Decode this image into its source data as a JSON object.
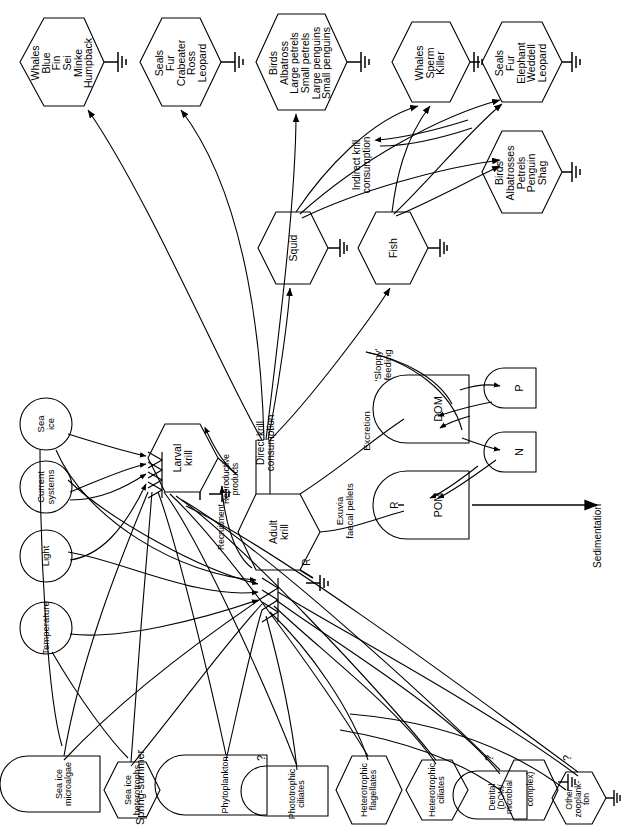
{
  "diagram": {
    "orientation": "text rotated 90 degrees counter-clockwise",
    "line_color": "#000000",
    "background_color": "#ffffff"
  },
  "consumers_top": [
    {
      "id": "whales-baleen",
      "shape": "hexagon",
      "label": "Whales\nBlue\nFin\nSei\nMinke\nHumpback"
    },
    {
      "id": "seals-1",
      "shape": "hexagon",
      "label": "Seals\nFur\nCrabeater\nRoss\nLeopard"
    },
    {
      "id": "birds-1",
      "shape": "hexagon",
      "label": "Birds\nAlbatross\nLarge petrels\nSmall petrels\nLarge penguins\nSmall penguins"
    },
    {
      "id": "whales-toothed",
      "shape": "hexagon",
      "label": "Whales\nSperm\nKiller"
    },
    {
      "id": "seals-2",
      "shape": "hexagon",
      "label": "Seals\nFur\nElephant\nWeddell\nLeopard"
    },
    {
      "id": "birds-2",
      "shape": "hexagon",
      "label": "Birds\nAlbatrosses\nPetrels\nPenguin\nShag"
    }
  ],
  "mid_consumers": [
    {
      "id": "squid",
      "shape": "hexagon",
      "label": "Squid"
    },
    {
      "id": "fish",
      "shape": "hexagon",
      "label": "Fish"
    }
  ],
  "krill": [
    {
      "id": "larval-krill",
      "shape": "hexagon",
      "label": "Larval\nkrill"
    },
    {
      "id": "adult-krill",
      "shape": "hexagon",
      "label": "Adult\nkrill"
    }
  ],
  "nutrient_pools": [
    {
      "id": "dom",
      "shape": "tank",
      "label": "DOM"
    },
    {
      "id": "pom",
      "shape": "tank",
      "label": "POM"
    },
    {
      "id": "p",
      "shape": "tank",
      "label": "P"
    },
    {
      "id": "n",
      "shape": "tank",
      "label": "N"
    }
  ],
  "drivers": [
    {
      "id": "sea-ice",
      "shape": "circle",
      "label": "Sea\nice"
    },
    {
      "id": "current-systems",
      "shape": "circle",
      "label": "Current\nsystems"
    },
    {
      "id": "light",
      "shape": "circle",
      "label": "Light"
    },
    {
      "id": "temperature",
      "shape": "circle",
      "label": "Temperature"
    }
  ],
  "producers_bottom": [
    {
      "id": "sea-ice-microalgae",
      "shape": "tank",
      "label": "Sea ice\nmicroalgae"
    },
    {
      "id": "sea-ice-heterotrophs",
      "shape": "hexagon",
      "label": "Sea ice\nheterotrophs"
    },
    {
      "id": "phytoplankton",
      "shape": "tank",
      "label": "Phytoplankton"
    },
    {
      "id": "phototrophic-ciliates",
      "shape": "tank",
      "label": "Phototrophic\nciliates"
    },
    {
      "id": "heterotrophic-flagellates",
      "shape": "hexagon",
      "label": "Heterotrophic\nflagellates"
    },
    {
      "id": "heterotrophic-ciliates",
      "shape": "hexagon",
      "label": "Heterotrophic\nciliates"
    },
    {
      "id": "detrital-complex",
      "shape": "tank-hexagon",
      "label": "Detrital\n(DOM/\nmicrobial",
      "label2": "complex)"
    },
    {
      "id": "other-zooplankton",
      "shape": "hexagon",
      "label": "Other\nzooplank-\nton"
    }
  ],
  "flow_labels": [
    {
      "id": "indirect-krill-consumption",
      "text": "Indirect krill\nconsumption"
    },
    {
      "id": "direct-krill-consumption",
      "text": "Direct krill\nconsumption"
    },
    {
      "id": "sloppy-feeding",
      "text": "'Sloppy'\nfeeding"
    },
    {
      "id": "excretion",
      "text": "Excretion"
    },
    {
      "id": "exuvia-faecal-pellets",
      "text": "Exuvia\nfaecal pellets"
    },
    {
      "id": "recruitment",
      "text": "Recruitment"
    },
    {
      "id": "reproductive-products",
      "text": "Reproductive\nproducts"
    },
    {
      "id": "sedimentation",
      "text": "Sedimentation"
    },
    {
      "id": "spring-summer",
      "text": "Spring-summer"
    },
    {
      "id": "respiration-adult-krill",
      "text": "R"
    },
    {
      "id": "respiration-pom",
      "text": "R"
    }
  ],
  "query_marks": [
    {
      "id": "q-phototrophic-ciliates",
      "text": "?"
    },
    {
      "id": "q-detrital-complex",
      "text": "?"
    },
    {
      "id": "q-other-zooplankton",
      "text": "?"
    }
  ]
}
